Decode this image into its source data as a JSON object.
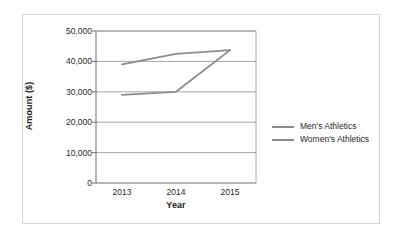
{
  "chart_data": {
    "type": "line",
    "title": "",
    "xlabel": "Year",
    "ylabel": "Amount ($)",
    "categories": [
      "2013",
      "2014",
      "2015"
    ],
    "x_tick_labels": [
      "2013",
      "2014",
      "2015"
    ],
    "y_tick_labels": [
      "0",
      "10,000",
      "20,000",
      "30,000",
      "40,000",
      "50,000"
    ],
    "y_tick_values": [
      0,
      10000,
      20000,
      30000,
      40000,
      50000
    ],
    "ylim": [
      0,
      50000
    ],
    "grid": "horizontal",
    "legend_position": "right",
    "series": [
      {
        "name": "Men's Athletics",
        "color": "#8c8c8c",
        "values": [
          39000,
          42500,
          43700
        ]
      },
      {
        "name": "Women's Athletics",
        "color": "#8c8c8c",
        "values": [
          29000,
          30000,
          43700
        ]
      }
    ]
  },
  "axes": {
    "y_title": "Amount ($)",
    "x_title": "Year"
  },
  "legend": {
    "entries": [
      {
        "label": "Men's Athletics",
        "color": "#8c8c8c"
      },
      {
        "label": "Women's Athletics",
        "color": "#8c8c8c"
      }
    ]
  },
  "style": {
    "frame_color": "#d5d5d5",
    "axis_color": "#6e6e6e",
    "grid_color": "#8f8f8f",
    "text_color": "#1f1f1f",
    "background": "#ffffff"
  }
}
